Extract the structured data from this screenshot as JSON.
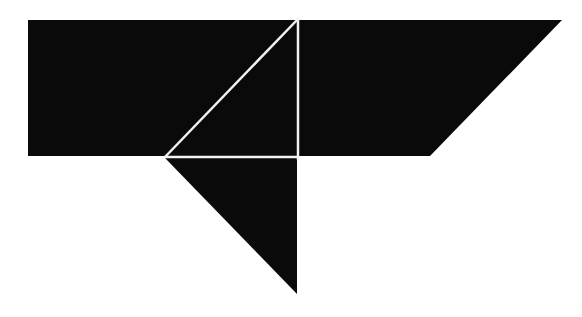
{
  "figure": {
    "type": "tangram-silhouette",
    "width": 582,
    "height": 317,
    "background": "#ffffff",
    "fill_color": "#0a0a0a",
    "separator_color": "#f2f2f2",
    "pieces": [
      {
        "name": "left-square-block",
        "points": "28,20 297,20 297,156 28,156"
      },
      {
        "name": "right-parallelogram",
        "points": "299,20 562,20 430,156 299,156"
      },
      {
        "name": "lower-triangle",
        "points": "165,158 297,158 297,294"
      }
    ],
    "separators": [
      {
        "name": "diagonal-line",
        "x1": 297,
        "y1": 20,
        "x2": 165,
        "y2": 157
      },
      {
        "name": "vertical-line",
        "x1": 298,
        "y1": 18,
        "x2": 298,
        "y2": 160
      },
      {
        "name": "horizontal-line",
        "x1": 165,
        "y1": 157,
        "x2": 298,
        "y2": 157
      }
    ]
  }
}
